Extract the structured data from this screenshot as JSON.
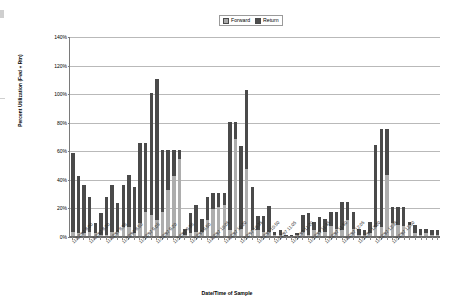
{
  "legend": {
    "position": "top-center",
    "entries": [
      {
        "name": "forward",
        "label": "Forward",
        "color": "#adadad"
      },
      {
        "name": "return",
        "label": "Return",
        "color": "#4a4a4a"
      }
    ]
  },
  "axes": {
    "y_title": "Percent Utilization (Fwd + Rtn)",
    "x_title": "Date/Time of Sample",
    "y_ticks": [
      "0%",
      "20%",
      "40%",
      "60%",
      "80%",
      "100%",
      "120%",
      "140%"
    ]
  },
  "chart_data": {
    "type": "bar",
    "subtype": "stacked-column",
    "title": "",
    "xlabel": "Date/Time of Sample",
    "ylabel": "Percent Utilization (Fwd + Rtn)",
    "ylim": [
      0,
      140
    ],
    "ytick_values": [
      0,
      20,
      40,
      60,
      80,
      100,
      120,
      140
    ],
    "ytick_labels": [
      "0%",
      "20%",
      "40%",
      "60%",
      "80%",
      "100%",
      "120%",
      "140%"
    ],
    "grid": "horizontal",
    "legend_position": "top-center",
    "categories": [
      "11/12/97 8:00",
      "11/12/97 8:05",
      "11/12/97 8:10",
      "11/12/97 8:15",
      "11/12/97 8:20",
      "11/12/97 8:25",
      "11/12/97 8:30",
      "11/12/97 8:35",
      "11/12/97 8:40",
      "11/12/97 8:45",
      "11/12/97 8:50",
      "11/12/97 8:55",
      "11/12/97 9:00",
      "11/12/97 9:05",
      "11/12/97 9:10",
      "11/12/97 9:15",
      "11/12/97 9:20",
      "11/12/97 9:25",
      "11/12/97 9:30",
      "11/12/97 9:35",
      "11/12/97 9:40",
      "11/12/97 9:45",
      "11/12/97 9:50",
      "11/12/97 9:55",
      "11/12/97 10:00",
      "11/12/97 10:05",
      "11/12/97 10:10",
      "11/12/97 10:15",
      "11/12/97 10:20",
      "11/12/97 10:25",
      "11/12/97 10:30",
      "11/12/97 10:35",
      "11/12/97 10:40",
      "11/12/97 10:45",
      "11/12/97 10:50",
      "11/12/97 10:55",
      "11/12/97 11:00",
      "11/12/97 11:05",
      "11/12/97 11:10",
      "11/12/97 11:15",
      "11/12/97 11:20",
      "11/12/97 11:25",
      "11/12/97 11:30",
      "11/12/97 11:35",
      "11/12/97 11:40",
      "11/12/97 11:45",
      "11/12/97 11:50",
      "11/12/97 11:55",
      "11/12/97 12:00",
      "11/12/97 12:05",
      "11/12/97 12:10",
      "11/12/97 12:15",
      "11/12/97 12:20",
      "11/12/97 12:25",
      "11/12/97 12:30",
      "11/12/97 12:35",
      "11/12/97 12:40",
      "11/12/97 12:45",
      "11/12/97 12:50",
      "11/12/97 12:55",
      "11/12/97 13:00",
      "11/12/97 13:05",
      "11/12/97 13:10",
      "11/12/97 13:15",
      "11/12/97 13:20",
      "11/12/97 13:25"
    ],
    "visible_xtick_labels": [
      {
        "index": 0,
        "label": "11/12/97 8:00"
      },
      {
        "index": 3,
        "label": "11/12/97 8:20"
      },
      {
        "index": 6,
        "label": "11/12/97 8:35"
      },
      {
        "index": 9,
        "label": "11/12/97 8:50"
      },
      {
        "index": 12,
        "label": "11/12/97 9:05"
      },
      {
        "index": 15,
        "label": "11/12/97 9:20"
      },
      {
        "index": 18,
        "label": "11/12/97 9:35"
      },
      {
        "index": 21,
        "label": "11/12/97 9:50"
      },
      {
        "index": 24,
        "label": "11/12/97 10:05"
      },
      {
        "index": 27,
        "label": "11/12/97 10:20"
      },
      {
        "index": 30,
        "label": "11/12/97 10:35"
      },
      {
        "index": 33,
        "label": "11/12/97 10:50"
      },
      {
        "index": 36,
        "label": "11/12/97 11:05"
      },
      {
        "index": 39,
        "label": "11/12/97 11:20"
      },
      {
        "index": 42,
        "label": "11/12/97 11:35"
      },
      {
        "index": 45,
        "label": "11/12/97 11:50"
      },
      {
        "index": 48,
        "label": "11/12/97 12:05"
      },
      {
        "index": 51,
        "label": "11/12/97 12:20"
      },
      {
        "index": 54,
        "label": "11/12/97 12:35"
      },
      {
        "index": 57,
        "label": "11/12/97 12:50"
      }
    ],
    "series": [
      {
        "name": "Forward",
        "color": "#adadad",
        "values": [
          3,
          2,
          2,
          3,
          2,
          1,
          1,
          3,
          3,
          6,
          6,
          2,
          9,
          17,
          15,
          11,
          17,
          32,
          42,
          54,
          1,
          2,
          3,
          3,
          11,
          19,
          20,
          22,
          4,
          68,
          5,
          47,
          4,
          4,
          3,
          3,
          1,
          1,
          0,
          0,
          1,
          3,
          1,
          4,
          3,
          3,
          7,
          5,
          4,
          11,
          5,
          1,
          1,
          2,
          6,
          6,
          43,
          9,
          8,
          7,
          8,
          2,
          1,
          2,
          1,
          1
        ]
      },
      {
        "name": "Return",
        "color": "#4a4a4a",
        "values": [
          55,
          40,
          34,
          24,
          7,
          15,
          26,
          33,
          20,
          30,
          37,
          32,
          56,
          48,
          85,
          99,
          43,
          28,
          18,
          6,
          4,
          14,
          19,
          9,
          16,
          11,
          10,
          8,
          76,
          12,
          58,
          55,
          30,
          10,
          11,
          18,
          2,
          3,
          1,
          1,
          1,
          12,
          15,
          6,
          10,
          9,
          10,
          12,
          20,
          13,
          12,
          4,
          3,
          8,
          58,
          69,
          32,
          11,
          12,
          13,
          2,
          6,
          4,
          3,
          3,
          3
        ]
      }
    ]
  }
}
